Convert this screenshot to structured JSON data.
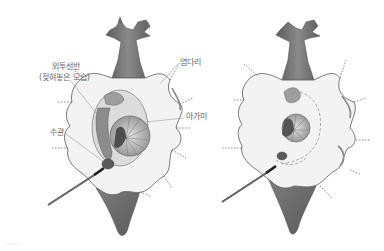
{
  "diagram": {
    "type": "anatomical-illustration",
    "panels": [
      {
        "id": "left",
        "description": "dissected specimen with mantle shelf folded back",
        "labels": [
          {
            "id": "mantle_shelf",
            "text": "외투선반",
            "x": 52,
            "y": 66
          },
          {
            "id": "mantle_shelf_note",
            "text": "(젖혀놓은 모습)",
            "x": 39,
            "y": 77
          },
          {
            "id": "siphon",
            "text": "수관",
            "x": 50,
            "y": 131
          },
          {
            "id": "fin_edge",
            "text": "염다리",
            "x": 180,
            "y": 60
          },
          {
            "id": "gill",
            "text": "아가미",
            "x": 186,
            "y": 114
          }
        ]
      },
      {
        "id": "right",
        "description": "specimen with mantle shelf in place, gill outline dashed",
        "labels": []
      }
    ],
    "footer_marks": "·····",
    "colors": {
      "body_fill": "#f2f2f2",
      "body_stroke": "#7a7a7a",
      "dark_tissue": "#6e6e6e",
      "mid_tissue": "#9a9a9a",
      "light_tissue": "#c8c8c8",
      "label_text": "#666666",
      "leader_line": "#8a8a8a"
    }
  }
}
